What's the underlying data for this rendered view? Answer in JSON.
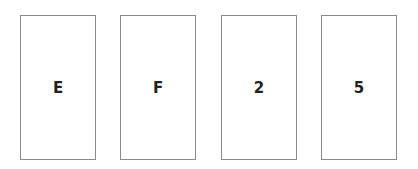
{
  "cards": [
    {
      "label": "E",
      "left": 20
    },
    {
      "label": "F",
      "left": 120
    },
    {
      "label": "2",
      "left": 221
    },
    {
      "label": "5",
      "left": 321
    }
  ]
}
